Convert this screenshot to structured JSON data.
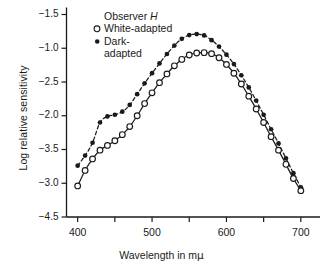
{
  "figure": {
    "background": "#ffffff",
    "ink": "#1a1a1a"
  },
  "axes": {
    "y_title": "Log relative sensitivity",
    "x_title_text": "Wavelength in m",
    "x_title_unit": "μ",
    "y_ticklabels": [
      "−1.5",
      "−1.0",
      "−2.5",
      "−2.0",
      "−3.5",
      "−3.0",
      "−4.5"
    ],
    "x_ticklabels": [
      "400",
      "500",
      "600",
      "700"
    ],
    "x_major_values": [
      400,
      500,
      600,
      700
    ],
    "x_minor_values": [
      450,
      550,
      650
    ],
    "xlim": [
      385,
      715
    ],
    "grid": "off",
    "frame": "left-and-bottom-spines"
  },
  "legend": {
    "position": "upper-left-inside",
    "title": "Observer ",
    "title_italic": "H",
    "items": [
      {
        "label": "White-adapted",
        "marker": "open-circle",
        "line": "solid"
      },
      {
        "label": "Dark-",
        "label_cont": "adapted",
        "marker": "filled-circle",
        "line": "dashed"
      }
    ]
  },
  "chart_data": {
    "type": "line",
    "title": "",
    "subtitle": "",
    "xlabel": "Wavelength in mμ",
    "ylabel": "Log relative sensitivity",
    "xlim": [
      385,
      715
    ],
    "ylim_index": [
      0,
      6
    ],
    "grid": false,
    "legend_position": "upper-left",
    "annotations": [
      "Observer H"
    ],
    "y_axis_printed_ticklabels": [
      "-1.5",
      "-1.0",
      "-2.5",
      "-2.0",
      "-3.5",
      "-3.0",
      "-4.5"
    ],
    "note": "y values below are given in tick-index units (0 = topmost printed tick -1.5, 6 = bottom printed tick -4.5); ticks are evenly spaced on the page.",
    "series": [
      {
        "name": "Dark-adapted",
        "marker": "filled-circle",
        "line": "dashed",
        "x": [
          400,
          410,
          420,
          430,
          440,
          450,
          460,
          470,
          480,
          490,
          500,
          510,
          520,
          530,
          540,
          550,
          560,
          570,
          580,
          590,
          600,
          610,
          620,
          630,
          640,
          650,
          660,
          670,
          680,
          690,
          700
        ],
        "y": [
          4.48,
          4.18,
          3.8,
          3.2,
          3.02,
          2.97,
          2.88,
          2.68,
          2.36,
          2.04,
          1.74,
          1.45,
          1.17,
          0.92,
          0.72,
          0.61,
          0.58,
          0.62,
          0.76,
          0.95,
          1.19,
          1.47,
          1.8,
          2.16,
          2.55,
          2.97,
          3.4,
          3.82,
          4.26,
          4.7,
          5.12
        ]
      },
      {
        "name": "White-adapted",
        "marker": "open-circle",
        "line": "solid",
        "x": [
          400,
          410,
          420,
          430,
          440,
          450,
          460,
          470,
          480,
          490,
          500,
          510,
          520,
          530,
          540,
          550,
          560,
          570,
          580,
          590,
          600,
          610,
          620,
          630,
          640,
          650,
          660,
          670,
          680,
          690,
          700
        ],
        "y": [
          5.08,
          4.62,
          4.28,
          4.02,
          3.88,
          3.74,
          3.56,
          3.32,
          3.0,
          2.64,
          2.32,
          2.02,
          1.76,
          1.52,
          1.33,
          1.2,
          1.14,
          1.13,
          1.16,
          1.28,
          1.48,
          1.74,
          2.06,
          2.42,
          2.8,
          3.2,
          3.62,
          4.02,
          4.44,
          4.86,
          5.22
        ]
      }
    ]
  }
}
